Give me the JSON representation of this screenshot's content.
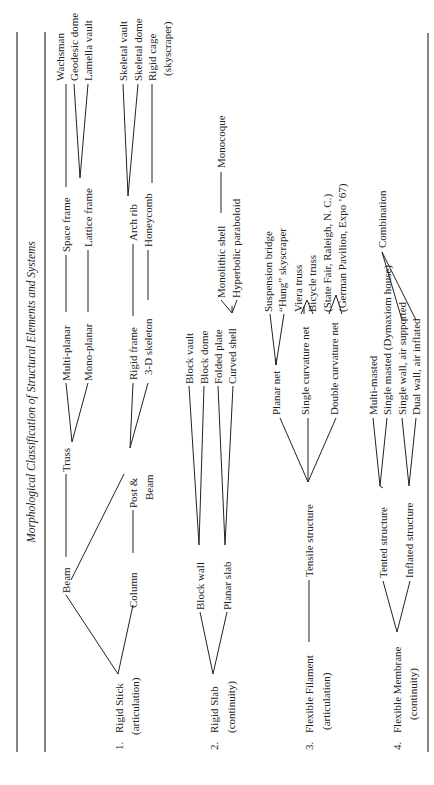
{
  "table": {
    "title": "Morphological Classification of Structural Elements and Systems",
    "rows": [
      {
        "number": "1.",
        "category": "Rigid Stick",
        "subtitle": "(articulation)",
        "elements": [
          "Beam",
          "Column"
        ],
        "systems": [
          "Truss",
          "Post &",
          "Beam"
        ],
        "subsystems": [
          "Multi-planar",
          "Mono-planar",
          "Rigid frame",
          "3-D skeleton"
        ],
        "types": [
          "Space frame",
          "Lattice frame",
          "Arch rib",
          "Honeycomb"
        ],
        "examples": [
          "Wachsman",
          "Geodesic dome",
          "Lamella vault",
          "Skeletal vault",
          "Skeletal dome",
          "Rigid cage",
          "(skyscraper)"
        ]
      },
      {
        "number": "2.",
        "category": "Rigid Slab",
        "subtitle": "(continuity)",
        "elements": [
          "Block wall",
          "Planar slab"
        ],
        "types": [
          "Block vault",
          "Block dome",
          "Folded plate",
          "Curved shell"
        ],
        "subtypes": [
          "Monolithic shell",
          "Hyperbolic paraboloid"
        ],
        "examples": [
          "Monocoque"
        ]
      },
      {
        "number": "3.",
        "category": "Flexible Filament",
        "subtitle": "(articulation)",
        "elements": [
          "Tensile structure"
        ],
        "types": [
          "Planar net",
          "Single curvature net",
          "Double curvature net"
        ],
        "examples": [
          "Suspension bridge",
          "“Hung” skyscraper",
          "Viera truss",
          "Bicycle truss",
          "(State Fair, Raleigh, N. C.)",
          "(German Pavilion, Expo ’67)"
        ]
      },
      {
        "number": "4.",
        "category": "Flexible Membrane",
        "subtitle": "(continuity)",
        "elements": [
          "Tented structure",
          "Inflated structure"
        ],
        "types": [
          "Multi-masted",
          "Single masted (Dymaxiom house)",
          "Single wall, air supported",
          "Dual wall, air inflated"
        ],
        "examples": [
          "Combination"
        ]
      }
    ]
  }
}
